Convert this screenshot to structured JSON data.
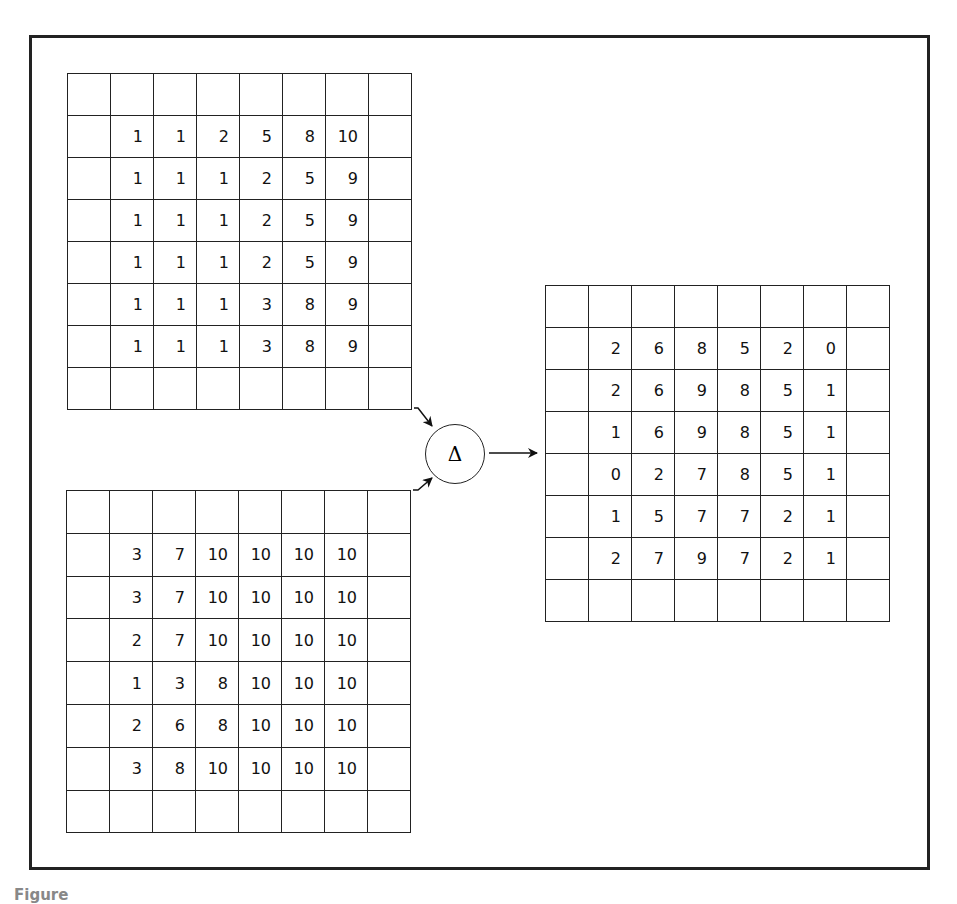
{
  "figure": {
    "operator_symbol": "Δ",
    "operator_name": "difference",
    "caption_partial": "Figure"
  },
  "grids": {
    "input_a": {
      "rows": 8,
      "cols": 8,
      "values": [
        [
          "",
          "",
          "",
          "",
          "",
          "",
          "",
          ""
        ],
        [
          "",
          "1",
          "1",
          "2",
          "5",
          "8",
          "10",
          ""
        ],
        [
          "",
          "1",
          "1",
          "1",
          "2",
          "5",
          "9",
          ""
        ],
        [
          "",
          "1",
          "1",
          "1",
          "2",
          "5",
          "9",
          ""
        ],
        [
          "",
          "1",
          "1",
          "1",
          "2",
          "5",
          "9",
          ""
        ],
        [
          "",
          "1",
          "1",
          "1",
          "3",
          "8",
          "9",
          ""
        ],
        [
          "",
          "1",
          "1",
          "1",
          "3",
          "8",
          "9",
          ""
        ],
        [
          "",
          "",
          "",
          "",
          "",
          "",
          "",
          ""
        ]
      ]
    },
    "input_b": {
      "rows": 8,
      "cols": 8,
      "values": [
        [
          "",
          "",
          "",
          "",
          "",
          "",
          "",
          ""
        ],
        [
          "",
          "3",
          "7",
          "10",
          "10",
          "10",
          "10",
          ""
        ],
        [
          "",
          "3",
          "7",
          "10",
          "10",
          "10",
          "10",
          ""
        ],
        [
          "",
          "2",
          "7",
          "10",
          "10",
          "10",
          "10",
          ""
        ],
        [
          "",
          "1",
          "3",
          "8",
          "10",
          "10",
          "10",
          ""
        ],
        [
          "",
          "2",
          "6",
          "8",
          "10",
          "10",
          "10",
          ""
        ],
        [
          "",
          "3",
          "8",
          "10",
          "10",
          "10",
          "10",
          ""
        ],
        [
          "",
          "",
          "",
          "",
          "",
          "",
          "",
          ""
        ]
      ]
    },
    "output": {
      "rows": 8,
      "cols": 8,
      "values": [
        [
          "",
          "",
          "",
          "",
          "",
          "",
          "",
          ""
        ],
        [
          "",
          "2",
          "6",
          "8",
          "5",
          "2",
          "0",
          ""
        ],
        [
          "",
          "2",
          "6",
          "9",
          "8",
          "5",
          "1",
          ""
        ],
        [
          "",
          "1",
          "6",
          "9",
          "8",
          "5",
          "1",
          ""
        ],
        [
          "",
          "0",
          "2",
          "7",
          "8",
          "5",
          "1",
          ""
        ],
        [
          "",
          "1",
          "5",
          "7",
          "7",
          "2",
          "1",
          ""
        ],
        [
          "",
          "2",
          "7",
          "9",
          "7",
          "2",
          "1",
          ""
        ],
        [
          "",
          "",
          "",
          "",
          "",
          "",
          "",
          ""
        ]
      ]
    }
  }
}
